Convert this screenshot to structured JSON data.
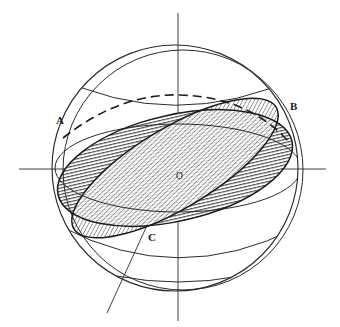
{
  "figure": {
    "background_color": "#ffffff",
    "stroke_color": "#1a1a1a",
    "hatch_color": "#3a3a3a",
    "width": 340,
    "height": 327
  },
  "labels": {
    "a": "A",
    "b": "B",
    "c": "C",
    "o": "O"
  },
  "label_positions": {
    "a": {
      "x": 56,
      "y": 124
    },
    "b": {
      "x": 290,
      "y": 110
    },
    "c": {
      "x": 148,
      "y": 240
    },
    "o": {
      "x": 176,
      "y": 179
    }
  },
  "geometry": {
    "sphere_center": {
      "x": 175,
      "y": 168
    },
    "sphere_radius": 123,
    "secondary_circle_center": {
      "x": 182,
      "y": 170
    },
    "secondary_circle_radius": 121,
    "equator_rx": 123,
    "equator_ry": 43,
    "axis_vertical": {
      "x": 178,
      "y1": 13,
      "y2": 321
    },
    "axis_horizontal": {
      "y": 169,
      "x1": 19,
      "x2": 326
    },
    "oblique_axis": {
      "x1": 196,
      "y1": 120,
      "x2": 107,
      "y2": 313
    },
    "disc_horizontal_hatched": {
      "rx": 120,
      "ry": 53,
      "rotation_deg": -13,
      "hatch": "horizontal"
    },
    "disc_diagonal_hatched": {
      "rx": 118,
      "ry": 40,
      "rotation_deg": -31,
      "hatch": "diagonal"
    }
  },
  "elements": {
    "outer_sphere_outline": "sphere-outline",
    "inner_sphere_outline": "sphere-outline-secondary",
    "equator_ellipse": "equator",
    "upper_latitude": "latitude-upper",
    "lower_latitude": "latitude-lower",
    "dashed_arc": "hidden-arc-dashed"
  }
}
